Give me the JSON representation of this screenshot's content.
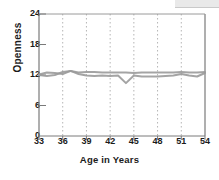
{
  "chart_data": {
    "type": "line",
    "title": "",
    "xlabel": "Age in Years",
    "ylabel": "Openness",
    "xlim": [
      33,
      54
    ],
    "ylim": [
      0,
      24
    ],
    "xticks": [
      33,
      36,
      39,
      42,
      45,
      48,
      51,
      54
    ],
    "yticks": [
      0,
      6,
      12,
      18,
      24
    ],
    "grid": "vertical-dotted",
    "legend": "none",
    "line_color": "#9a9a9a",
    "x": [
      33,
      34,
      35,
      36,
      37,
      38,
      39,
      40,
      41,
      42,
      43,
      44,
      45,
      46,
      47,
      48,
      49,
      50,
      51,
      52,
      53,
      54
    ],
    "series": [
      {
        "name": "Series 1",
        "values": [
          12.1,
          12.5,
          12.4,
          12.2,
          12.8,
          12.5,
          12.6,
          12.6,
          12.5,
          12.5,
          12.5,
          12.5,
          12.4,
          12.5,
          12.5,
          12.5,
          12.5,
          12.5,
          12.6,
          12.5,
          12.5,
          12.6
        ]
      },
      {
        "name": "Series 2",
        "values": [
          12.0,
          11.8,
          12.0,
          12.6,
          12.8,
          12.2,
          11.9,
          11.8,
          11.9,
          11.8,
          11.9,
          10.4,
          11.9,
          11.7,
          11.7,
          11.7,
          11.8,
          11.9,
          12.2,
          11.9,
          11.7,
          12.4
        ]
      }
    ]
  }
}
